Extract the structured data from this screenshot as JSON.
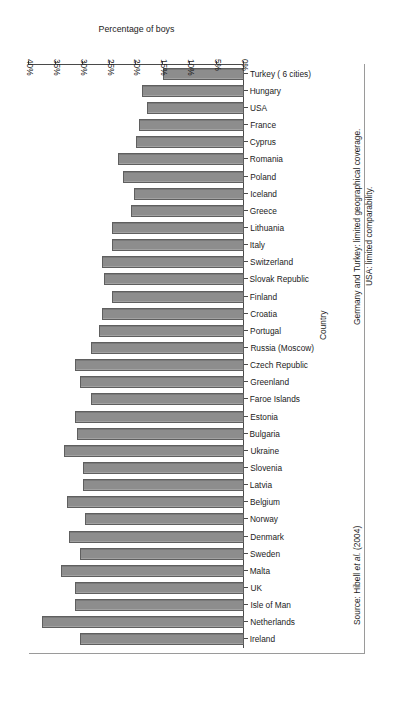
{
  "chart_data": {
    "type": "bar",
    "orientation": "horizontal",
    "title": "",
    "xlabel": "Percentage of boys",
    "ylabel": "Country",
    "xlim": [
      0,
      40
    ],
    "xticks": [
      "0%",
      "5%",
      "10%",
      "15%",
      "20%",
      "25%",
      "30%",
      "35%",
      "40%"
    ],
    "xtick_values": [
      0,
      5,
      10,
      15,
      20,
      25,
      30,
      35,
      40
    ],
    "grid": false,
    "legend": null,
    "bar_color": "#8d8d8d",
    "bar_edge_color": "#5f5f5f",
    "axis_color": "#4a4a4a",
    "categories": [
      "Ireland",
      "Netherlands",
      "Isle of Man",
      "UK",
      "Malta",
      "Sweden",
      "Denmark",
      "Norway",
      "Belgium",
      "Latvia",
      "Slovenia",
      "Ukraine",
      "Bulgaria",
      "Estonia",
      "Faroe Islands",
      "Greenland",
      "Czech Republic",
      "Russia (Moscow)",
      "Portugal",
      "Croatia",
      "Finland",
      "Slovak Republic",
      "Switzerland",
      "Italy",
      "Lithuania",
      "Greece",
      "Iceland",
      "Poland",
      "Romania",
      "Cyprus",
      "France",
      "USA",
      "Hungary",
      "Turkey ( 6 cities)"
    ],
    "values": [
      30.5,
      37.5,
      31.5,
      31.5,
      34.0,
      30.5,
      32.5,
      29.5,
      33.0,
      30.0,
      30.0,
      33.5,
      31.0,
      31.5,
      28.5,
      30.5,
      31.5,
      28.5,
      27.0,
      26.5,
      24.5,
      26.0,
      26.5,
      24.5,
      24.5,
      21.0,
      20.5,
      22.5,
      23.5,
      20.0,
      19.5,
      18.0,
      19.0,
      15.0
    ]
  },
  "notes": {
    "note1": "Germany and Turkey: limited geographical coverage.",
    "note2": "USA: limited comparability."
  },
  "source": {
    "prefix": "Source: Hibell ",
    "italic": "et al.",
    "suffix": " (2004)"
  }
}
